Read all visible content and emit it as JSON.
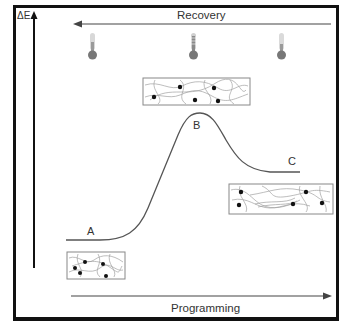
{
  "diagram": {
    "y_axis_label": "ΔE",
    "top_arrow_label": "Recovery",
    "bottom_arrow_label": "Programming",
    "states": [
      {
        "label": "A",
        "description": "low-energy permanent state"
      },
      {
        "label": "B",
        "description": "energy maximum, deformed at high temperature"
      },
      {
        "label": "C",
        "description": "metastable temporary state"
      }
    ],
    "thermometers": [
      {
        "position": "left",
        "level": "low"
      },
      {
        "position": "center",
        "level": "high"
      },
      {
        "position": "right",
        "level": "low"
      }
    ],
    "colors": {
      "frame": "#111111",
      "curve": "#555555",
      "text": "#333333",
      "network": "#9a9a9a",
      "crosslink": "#111111",
      "thermometer_bulb": "#777777"
    }
  }
}
